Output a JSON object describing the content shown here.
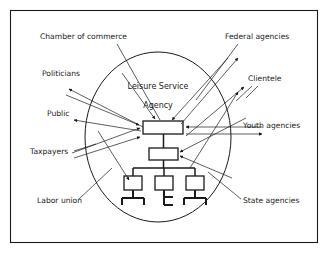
{
  "diagram": {
    "center": {
      "line1": "Leisure Service",
      "line2": "Agency"
    },
    "colors": {
      "ink": "#1a1a1a",
      "background": "#ffffff"
    },
    "external_labels": [
      {
        "id": "chamber-of-commerce",
        "text": "Chamber of commerce",
        "x": 40,
        "y": 39,
        "anchor": "start"
      },
      {
        "id": "politicians",
        "text": "Politicians",
        "x": 42,
        "y": 76,
        "anchor": "start"
      },
      {
        "id": "public",
        "text": "Public",
        "x": 47,
        "y": 116,
        "anchor": "start"
      },
      {
        "id": "taxpayers",
        "text": "Taxpayers",
        "x": 30,
        "y": 154,
        "anchor": "start"
      },
      {
        "id": "labor-union",
        "text": "Labor union",
        "x": 37,
        "y": 203,
        "anchor": "start"
      },
      {
        "id": "federal-agencies",
        "text": "Federal agencies",
        "x": 225,
        "y": 39,
        "anchor": "start"
      },
      {
        "id": "clientele",
        "text": "Clientele",
        "x": 248,
        "y": 81,
        "anchor": "start"
      },
      {
        "id": "youth-agencies",
        "text": "Youth agencies",
        "x": 243,
        "y": 128,
        "anchor": "start"
      },
      {
        "id": "state-agencies",
        "text": "State agencies",
        "x": 243,
        "y": 203,
        "anchor": "start"
      }
    ],
    "org_chart": {
      "boxes": [
        {
          "id": "agency-head-box",
          "x": 143,
          "y": 121,
          "w": 40,
          "h": 13
        },
        {
          "id": "agency-second-box",
          "x": 149,
          "y": 148,
          "w": 29,
          "h": 12
        },
        {
          "id": "unit-left-box",
          "x": 124,
          "y": 176,
          "w": 18,
          "h": 14
        },
        {
          "id": "unit-center-box",
          "x": 155,
          "y": 176,
          "w": 18,
          "h": 14
        },
        {
          "id": "unit-right-box",
          "x": 186,
          "y": 176,
          "w": 18,
          "h": 14
        }
      ]
    },
    "boundary": {
      "circle": {
        "cx": 158,
        "cy": 137,
        "rx": 73,
        "ry": 85
      },
      "frame": {
        "x": 10,
        "y": 10,
        "w": 308,
        "h": 233
      }
    }
  }
}
